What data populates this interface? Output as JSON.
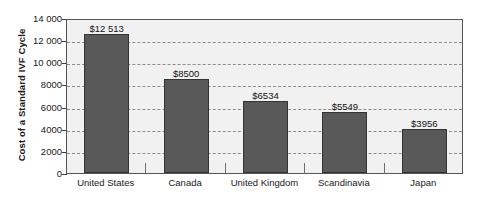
{
  "chart_data": {
    "type": "bar",
    "title": "",
    "xlabel": "",
    "ylabel": "Cost of a Standard IVF Cycle",
    "categories": [
      "United States",
      "Canada",
      "United Kingdom",
      "Scandinavia",
      "Japan"
    ],
    "values": [
      12513,
      8500,
      6534,
      5549,
      3956
    ],
    "value_labels": [
      "$12 513",
      "$8500",
      "$6534",
      "$5549",
      "$3956"
    ],
    "ylim": [
      0,
      14000
    ],
    "ytick_values": [
      0,
      2000,
      4000,
      6000,
      8000,
      10000,
      12000,
      14000
    ],
    "ytick_labels": [
      "0",
      "2000",
      "4000",
      "6000",
      "8000",
      "10 000",
      "12 000",
      "14 000"
    ],
    "grid": true,
    "grid_style": "dashed-horizontal",
    "legend": null,
    "bar_color": "#595959",
    "bar_edge_color": "#333333",
    "plot_background": "#f1f1f1",
    "plot_border_color": "#555555",
    "gridline_color": "#8d8d8d",
    "text_color": "#1a1a1a"
  }
}
